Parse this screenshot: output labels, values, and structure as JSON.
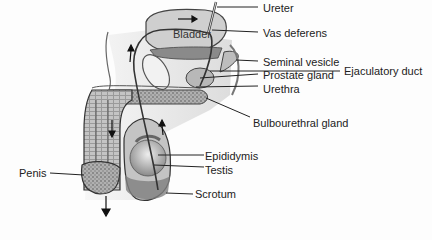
{
  "diagram": {
    "inner_label": "Bladder",
    "labels": {
      "ureter": "Ureter",
      "vas_deferens": "Vas deferens",
      "seminal_vesicle": "Seminal vesicle",
      "ejaculatory_duct": "Ejaculatory duct",
      "prostate_gland": "Prostate gland",
      "urethra": "Urethra",
      "bulbourethral_gland": "Bulbourethral gland",
      "epididymis": "Epididymis",
      "testis": "Testis",
      "scrotum": "Scrotum",
      "penis": "Penis"
    },
    "colors": {
      "background": "#fdfdfd",
      "tissue_light": "#d8d8d8",
      "tissue_mid": "#a8a8a8",
      "tissue_dark": "#6a6a6a",
      "line": "#222222"
    }
  }
}
